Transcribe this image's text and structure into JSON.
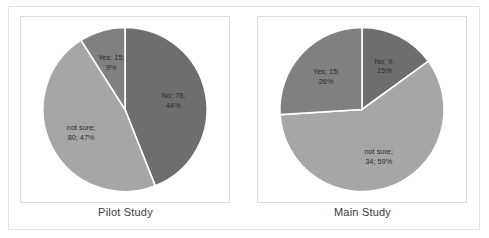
{
  "figure": {
    "background_color": "#ffffff",
    "frame_color": "#e3e3e3",
    "plot_border_color": "#dcdcdc"
  },
  "palette": {
    "no_color": "#6e6e6e",
    "not_sure_color": "#a6a6a6",
    "yes_color": "#808080",
    "slice_divider_color": "#ffffff",
    "label_text_color": "#2b2b2b",
    "caption_text_color": "#3a3a3a"
  },
  "chart_data": [
    {
      "type": "pie",
      "title": "Pilot Study",
      "caption": "Pilot Study",
      "categories": [
        "No",
        "not sure",
        "Yes"
      ],
      "values": [
        78,
        80,
        15
      ],
      "percentages": [
        44,
        47,
        9
      ],
      "labels": [
        "No; 78; 44%",
        "not sure; 80; 47%",
        "Yes; 15; 9%"
      ],
      "label_lines": [
        [
          "No; 78;",
          "44%"
        ],
        [
          "not sure;",
          "80; 47%"
        ],
        [
          "Yes; 15;",
          "9%"
        ]
      ],
      "colors": [
        "#6e6e6e",
        "#a6a6a6",
        "#808080"
      ],
      "start_angle_deg": 0,
      "direction": "clockwise",
      "legend": "none",
      "grid": false
    },
    {
      "type": "pie",
      "title": "Main Study",
      "caption": "Main Study",
      "categories": [
        "No",
        "not sure",
        "Yes"
      ],
      "values": [
        9,
        34,
        15
      ],
      "percentages": [
        15,
        59,
        26
      ],
      "labels": [
        "No; 9; 15%",
        "not sure; 34; 59%",
        "Yes; 15; 26%"
      ],
      "label_lines": [
        [
          "No; 9;",
          "15%"
        ],
        [
          "not sure;",
          "34; 59%"
        ],
        [
          "Yes; 15;",
          "26%"
        ]
      ],
      "colors": [
        "#6e6e6e",
        "#a6a6a6",
        "#808080"
      ],
      "start_angle_deg": 0,
      "direction": "clockwise",
      "legend": "none",
      "grid": false
    }
  ]
}
